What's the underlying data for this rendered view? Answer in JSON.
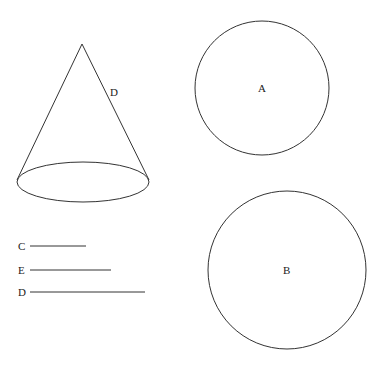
{
  "diagram": {
    "cone": {
      "slant_label": "D"
    },
    "circles": [
      {
        "label": "A"
      },
      {
        "label": "B"
      }
    ],
    "segments": [
      {
        "label": "C"
      },
      {
        "label": "E"
      },
      {
        "label": "D"
      }
    ],
    "stroke_color": "#333333"
  }
}
